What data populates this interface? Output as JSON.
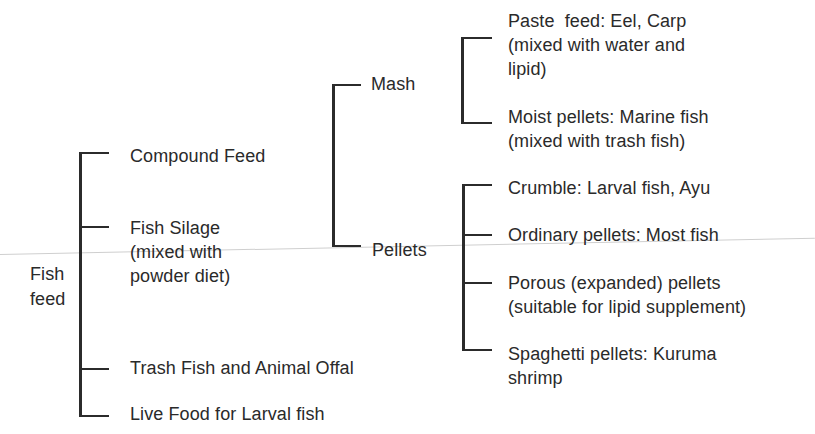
{
  "diagram": {
    "root": {
      "label_line1": "Fish",
      "label_line2": "feed"
    },
    "level1": [
      {
        "label": "Compound Feed"
      },
      {
        "label_line1": "Fish Silage",
        "label_line2": "(mixed with",
        "label_line3": "powder diet)"
      },
      {
        "label": "Trash Fish and Animal Offal"
      },
      {
        "label": "Live Food for Larval fish"
      }
    ],
    "compound_feed_types": [
      {
        "label": "Mash"
      },
      {
        "label": "Pellets"
      }
    ],
    "mash_types": [
      {
        "label_line1": "Paste  feed: Eel, Carp",
        "label_line2": "(mixed with water and",
        "label_line3": "lipid)"
      },
      {
        "label_line1": "Moist pellets: Marine fish",
        "label_line2": "(mixed with trash fish)"
      }
    ],
    "pellet_types": [
      {
        "label": "Crumble: Larval fish, Ayu"
      },
      {
        "label": "Ordinary pellets: Most fish"
      },
      {
        "label_line1": "Porous (expanded) pellets",
        "label_line2": "(suitable for lipid supplement)"
      },
      {
        "label_line1": "Spaghetti pellets: Kuruma",
        "label_line2": "shrimp"
      }
    ]
  }
}
